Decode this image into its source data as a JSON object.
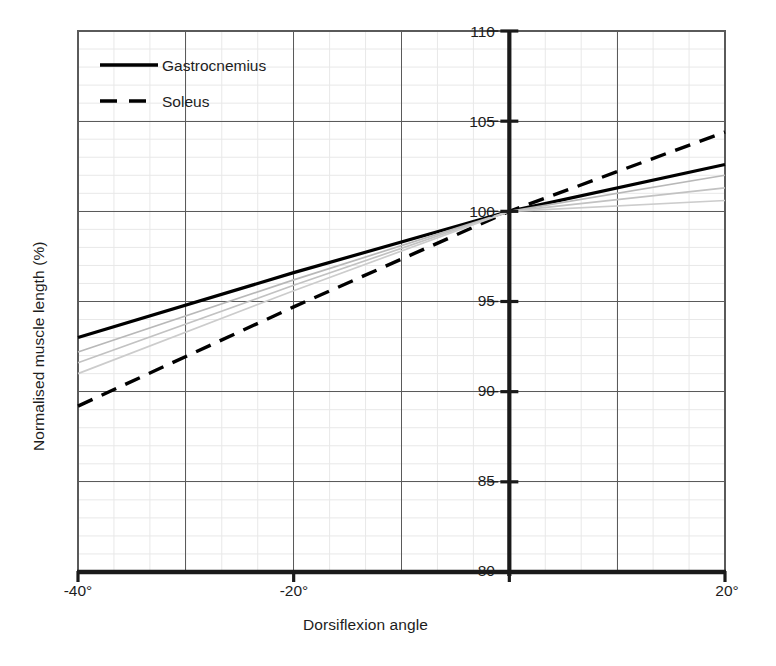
{
  "chart_data": {
    "type": "line",
    "title": "",
    "xlabel": "Dorsiflexion angle",
    "ylabel": "Normalised muscle length (%)",
    "xlim": [
      -40,
      20
    ],
    "ylim": [
      80,
      110
    ],
    "xticks": [
      -40,
      -20,
      0,
      20
    ],
    "xtick_labels": [
      "-40°",
      "-20°",
      "",
      "20°"
    ],
    "yticks": [
      80,
      85,
      90,
      95,
      100,
      105,
      110
    ],
    "ytick_labels": [
      "80",
      "85",
      "90",
      "95",
      "100",
      "105",
      "110"
    ],
    "grid": true,
    "grid_major_y_step": 5,
    "grid_minor_y_step": 1,
    "grid_major_x_step": 10,
    "grid_minor_x_step": 3.3333,
    "yaxis_position": 0,
    "legend_position": "upper left",
    "series": [
      {
        "name": "Gastrocnemius",
        "style": "solid",
        "color": "#000000",
        "width": 3.2,
        "x": [
          -40,
          -20,
          0,
          20
        ],
        "values": [
          93.0,
          96.6,
          100.0,
          102.6
        ]
      },
      {
        "name": "Soleus",
        "style": "dashed",
        "color": "#000000",
        "width": 3.4,
        "x": [
          -40,
          -20,
          0,
          20
        ],
        "values": [
          89.2,
          94.7,
          100.0,
          104.4
        ]
      },
      {
        "name": "reference-band-upper",
        "style": "solid",
        "color": "#b8b8b8",
        "width": 1.7,
        "x": [
          -40,
          -20,
          0,
          20
        ],
        "values": [
          92.2,
          96.2,
          100.0,
          102.0
        ]
      },
      {
        "name": "reference-band-middle",
        "style": "solid",
        "color": "#c2c2c2",
        "width": 1.7,
        "x": [
          -40,
          -20,
          0,
          20
        ],
        "values": [
          91.6,
          95.9,
          100.0,
          101.3
        ]
      },
      {
        "name": "reference-band-lower",
        "style": "solid",
        "color": "#cccccc",
        "width": 1.7,
        "x": [
          -40,
          -20,
          0,
          20
        ],
        "values": [
          91.0,
          95.6,
          100.0,
          100.6
        ]
      }
    ],
    "legend": [
      {
        "label": "Gastrocnemius",
        "style": "solid"
      },
      {
        "label": "Soleus",
        "style": "dashed"
      }
    ]
  },
  "axes": {
    "ylabel": "Normalised muscle length (%)",
    "xlabel": "Dorsiflexion angle"
  },
  "ytick_labels": {
    "t110": "110",
    "t105": "105",
    "t100": "100",
    "t95": "95",
    "t90": "90",
    "t85": "85",
    "t80": "80"
  },
  "xtick_labels": {
    "tm40": "-40°",
    "tm20": "-20°",
    "t20": "20°"
  },
  "legend": {
    "gastrocnemius": "Gastrocnemius",
    "soleus": "Soleus"
  },
  "colors": {
    "line": "#000000",
    "reference": "#c2c2c2",
    "grid_major": "#5a5a5a",
    "grid_minor": "#e8e8e8",
    "axis": "#1a1a1a"
  }
}
